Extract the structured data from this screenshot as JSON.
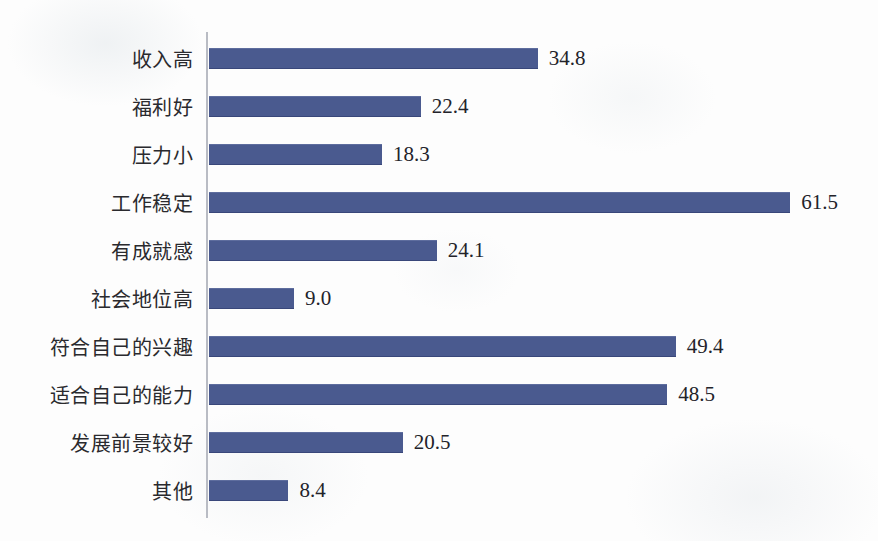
{
  "chart_data": {
    "type": "bar",
    "orientation": "horizontal",
    "title": "",
    "subtitle": "",
    "xlabel": "",
    "ylabel": "",
    "xlim": [
      0,
      61.5
    ],
    "grid": false,
    "legend": null,
    "value_labels_shown": true,
    "value_format": "one-decimal",
    "bar_color": "#4a5a8f",
    "axis_color": "#b9bcc4",
    "background_color": "#fdfdfd",
    "text_color": "#2a2a2e",
    "categories": [
      "收入高",
      "福利好",
      "压力小",
      "工作稳定",
      "有成就感",
      "社会地位高",
      "符合自己的兴趣",
      "适合自己的能力",
      "发展前景较好",
      "其他"
    ],
    "values": [
      34.8,
      22.4,
      18.3,
      61.5,
      24.1,
      9.0,
      49.4,
      48.5,
      20.5,
      8.4
    ],
    "value_labels": [
      "34.8",
      "22.4",
      "18.3",
      "61.5",
      "24.1",
      "9.0",
      "49.4",
      "48.5",
      "20.5",
      "8.4"
    ],
    "bars": [
      {
        "category": "收入高",
        "value": 34.8,
        "label": "34.8"
      },
      {
        "category": "福利好",
        "value": 22.4,
        "label": "22.4"
      },
      {
        "category": "压力小",
        "value": 18.3,
        "label": "18.3"
      },
      {
        "category": "工作稳定",
        "value": 61.5,
        "label": "61.5"
      },
      {
        "category": "有成就感",
        "value": 24.1,
        "label": "24.1"
      },
      {
        "category": "社会地位高",
        "value": 9.0,
        "label": "9.0"
      },
      {
        "category": "符合自己的兴趣",
        "value": 49.4,
        "label": "49.4"
      },
      {
        "category": "适合自己的能力",
        "value": 48.5,
        "label": "48.5"
      },
      {
        "category": "发展前景较好",
        "value": 20.5,
        "label": "20.5"
      },
      {
        "category": "其他",
        "value": 8.4,
        "label": "8.4"
      }
    ]
  },
  "layout": {
    "px_per_unit": 9.45,
    "bar_origin_x": 209,
    "first_row_top": 34,
    "row_height": 48
  }
}
